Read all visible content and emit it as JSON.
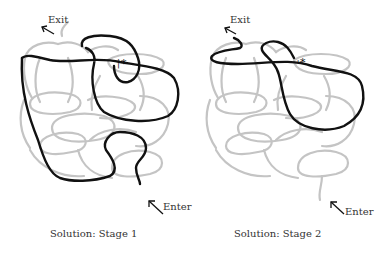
{
  "diagram": {
    "type": "knot-maze-solution",
    "colors": {
      "maze": "#c4c4c4",
      "solution_path": "#111111",
      "text": "#333333"
    },
    "panels": [
      {
        "id": "stage1",
        "exit_label": "Exit",
        "enter_label": "Enter",
        "marker": "*",
        "caption": "Solution: Stage 1"
      },
      {
        "id": "stage2",
        "exit_label": "Exit",
        "enter_label": "Enter",
        "marker": "*",
        "caption": "Solution: Stage 2"
      }
    ]
  }
}
